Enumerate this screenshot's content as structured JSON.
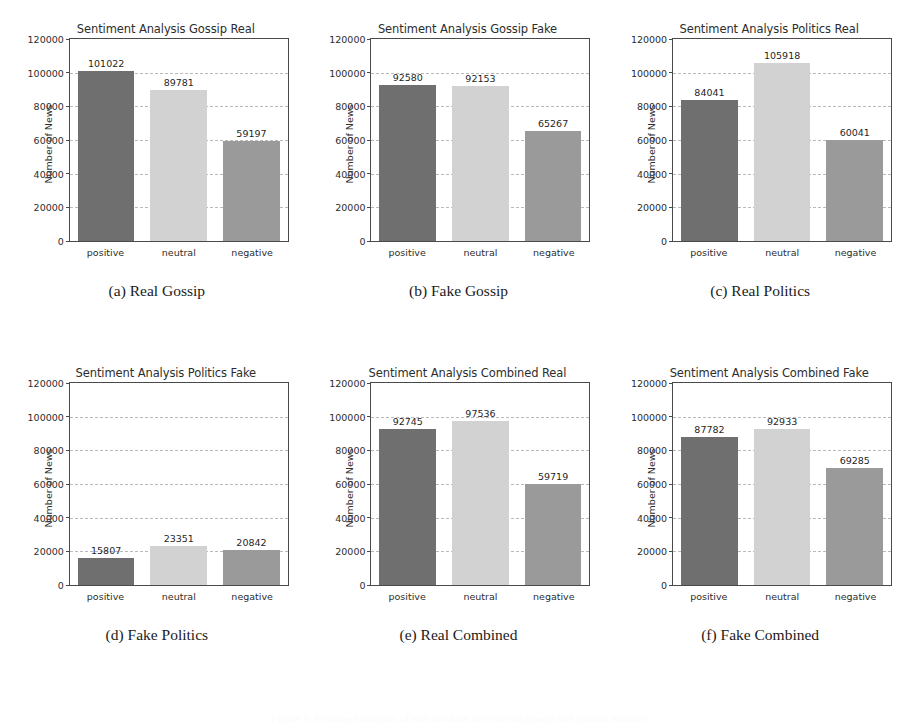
{
  "figure": {
    "footer_caption": "Figure 4: Sentiment analysis of real and fake news across gossip and politics datasets",
    "axis": {
      "ylabel": "Number of News",
      "yticks": [
        0,
        20000,
        40000,
        60000,
        80000,
        100000,
        120000
      ],
      "ytick_labels": [
        "0",
        "20000",
        "40000",
        "60000",
        "80000",
        "100000",
        "120000"
      ],
      "ymin": 0,
      "ymax": 120000,
      "categories": [
        "positive",
        "neutral",
        "negative"
      ]
    },
    "colors": {
      "bar_positive": "#6f6f6f",
      "bar_neutral": "#d2d2d2",
      "bar_negative": "#9a9a9a",
      "grid": "#b9b9b9",
      "axis": "#4a4a4a",
      "background": "#ffffff"
    }
  },
  "chart_data": [
    {
      "type": "bar",
      "panel": "a",
      "subcaption": "(a) Real Gossip",
      "title": "Sentiment Analysis Gossip Real",
      "xlabel": "",
      "ylabel": "Number of News",
      "categories": [
        "positive",
        "neutral",
        "negative"
      ],
      "values": [
        101022,
        89781,
        59197
      ],
      "ylim": [
        0,
        120000
      ],
      "grid": true
    },
    {
      "type": "bar",
      "panel": "b",
      "subcaption": "(b) Fake Gossip",
      "title": "Sentiment Analysis Gossip Fake",
      "xlabel": "",
      "ylabel": "Number of News",
      "categories": [
        "positive",
        "neutral",
        "negative"
      ],
      "values": [
        92580,
        92153,
        65267
      ],
      "ylim": [
        0,
        120000
      ],
      "grid": true
    },
    {
      "type": "bar",
      "panel": "c",
      "subcaption": "(c) Real Politics",
      "title": "Sentiment Analysis Politics Real",
      "xlabel": "",
      "ylabel": "Number of News",
      "categories": [
        "positive",
        "neutral",
        "negative"
      ],
      "values": [
        84041,
        105918,
        60041
      ],
      "ylim": [
        0,
        120000
      ],
      "grid": true
    },
    {
      "type": "bar",
      "panel": "d",
      "subcaption": "(d) Fake Politics",
      "title": "Sentiment Analysis Politics Fake",
      "xlabel": "",
      "ylabel": "Number of News",
      "categories": [
        "positive",
        "neutral",
        "negative"
      ],
      "values": [
        15807,
        23351,
        20842
      ],
      "ylim": [
        0,
        120000
      ],
      "grid": true
    },
    {
      "type": "bar",
      "panel": "e",
      "subcaption": "(e) Real Combined",
      "title": "Sentiment Analysis Combined Real",
      "xlabel": "",
      "ylabel": "Number of News",
      "categories": [
        "positive",
        "neutral",
        "negative"
      ],
      "values": [
        92745,
        97536,
        59719
      ],
      "ylim": [
        0,
        120000
      ],
      "grid": true
    },
    {
      "type": "bar",
      "panel": "f",
      "subcaption": "(f) Fake Combined",
      "title": "Sentiment Analysis Combined Fake",
      "xlabel": "",
      "ylabel": "Number of News",
      "categories": [
        "positive",
        "neutral",
        "negative"
      ],
      "values": [
        87782,
        92933,
        69285
      ],
      "ylim": [
        0,
        120000
      ],
      "grid": true
    }
  ]
}
